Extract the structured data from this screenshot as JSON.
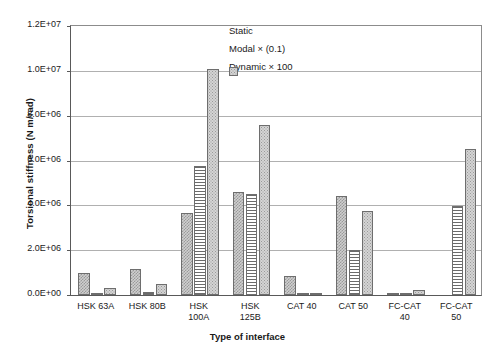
{
  "chart_data": {
    "type": "bar",
    "title": "",
    "xlabel": "Type of interface",
    "ylabel": "Torsional stiffness (N m/rad)",
    "ylim": [
      0,
      12000000
    ],
    "ytick_labels": [
      "1.2E+07",
      "1.0E+07",
      "8.0E+06",
      "6.0E+06",
      "4.0E+06",
      "2.0E+06",
      "0.0E+00"
    ],
    "ytick_values": [
      12000000,
      10000000,
      8000000,
      6000000,
      4000000,
      2000000,
      0
    ],
    "grid": true,
    "legend_position": "top-right",
    "categories": [
      "HSK 63A",
      "HSK 80B",
      "HSK 100A",
      "HSK 125B",
      "CAT 40",
      "CAT 50",
      "FC-CAT 40",
      "FC-CAT 50"
    ],
    "category_lines": [
      [
        "HSK 63A"
      ],
      [
        "HSK 80B"
      ],
      [
        "HSK",
        "100A"
      ],
      [
        "HSK",
        "125B"
      ],
      [
        "CAT 40"
      ],
      [
        "CAT 50"
      ],
      [
        "FC-CAT",
        "40"
      ],
      [
        "FC-CAT",
        "50"
      ]
    ],
    "series": [
      {
        "name": "Static",
        "pattern": "checker",
        "values": [
          1000000,
          1150000,
          3650000,
          4600000,
          850000,
          4400000,
          60000,
          0
        ]
      },
      {
        "name": "Modal × (0.1)",
        "pattern": "horizontal-lines",
        "values": [
          100000,
          120000,
          5750000,
          4500000,
          40000,
          2000000,
          70000,
          3950000
        ]
      },
      {
        "name": "Dynamic × 100",
        "pattern": "stipple",
        "values": [
          320000,
          500000,
          10100000,
          7600000,
          45000,
          3750000,
          230000,
          6500000
        ]
      }
    ]
  },
  "colors": {
    "axis": "#595959",
    "grid": "#b0b0b0",
    "bar_outline": "#6e6e6e",
    "static_fill": "#cfcfcf",
    "modal_fill": "#ffffff",
    "dynamic_fill": "#d4d4d4",
    "background": "#ffffff"
  }
}
